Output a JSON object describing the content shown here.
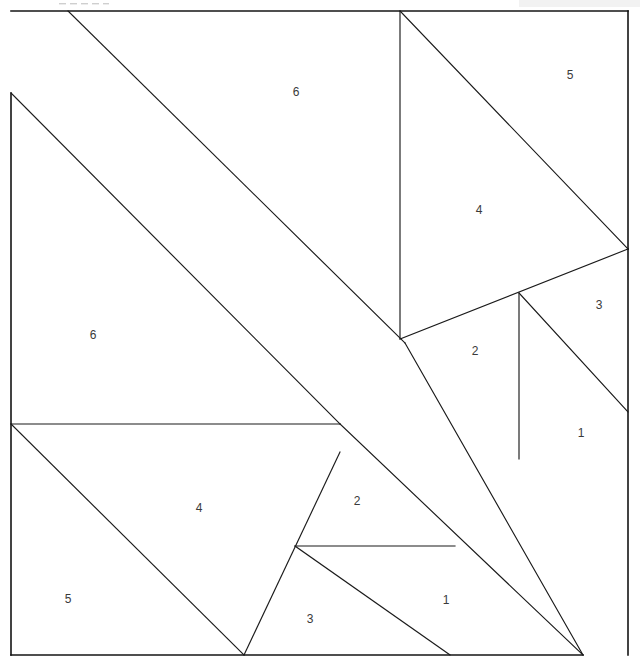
{
  "figure": {
    "kind": "geometric-dissection-diagram",
    "canvas": {
      "width": 640,
      "height": 668
    },
    "stroke_color": "#1a1a1a",
    "fill_color": "#ffffff",
    "label_color": "#3a3a3a"
  },
  "frame": {
    "top_left": [
      11,
      11
    ],
    "top_right": [
      628,
      11
    ],
    "bottom_left": [
      11,
      655
    ],
    "bottom_right": [
      628,
      655
    ]
  },
  "labels": [
    {
      "id": "label-6-upper",
      "text": "6",
      "x": 296,
      "y": 93
    },
    {
      "id": "label-5-upper",
      "text": "5",
      "x": 570,
      "y": 76
    },
    {
      "id": "label-4-upper",
      "text": "4",
      "x": 479,
      "y": 211
    },
    {
      "id": "label-3-upper",
      "text": "3",
      "x": 599,
      "y": 306
    },
    {
      "id": "label-2-upper",
      "text": "2",
      "x": 475,
      "y": 352
    },
    {
      "id": "label-1-upper",
      "text": "1",
      "x": 581,
      "y": 434
    },
    {
      "id": "label-6-lower",
      "text": "6",
      "x": 93,
      "y": 336
    },
    {
      "id": "label-4-lower",
      "text": "4",
      "x": 199,
      "y": 509
    },
    {
      "id": "label-2-lower",
      "text": "2",
      "x": 357,
      "y": 502
    },
    {
      "id": "label-5-lower",
      "text": "5",
      "x": 68,
      "y": 600
    },
    {
      "id": "label-3-lower",
      "text": "3",
      "x": 310,
      "y": 620
    },
    {
      "id": "label-1-lower",
      "text": "1",
      "x": 446,
      "y": 601
    }
  ],
  "pieces": [
    {
      "id": "piece-6-upper",
      "number": "6",
      "points": "68,11 400,11 400,339 405,343 11,11"
    },
    {
      "id": "piece-5-upper",
      "number": "5",
      "points": "400,11 628,11 628,249"
    },
    {
      "id": "piece-4-upper",
      "number": "4",
      "points": "400,11 628,249 519,293 400,339"
    },
    {
      "id": "piece-3-upper",
      "number": "3",
      "points": "628,249 628,412 519,293"
    },
    {
      "id": "piece-2-upper",
      "number": "2",
      "points": "400,339 519,293 519,459"
    },
    {
      "id": "piece-1-upper",
      "number": "1",
      "points": "519,293 628,412 628,655 519,459"
    },
    {
      "id": "piece-6-lower",
      "number": "6",
      "points": "11,93 340,424 11,424"
    },
    {
      "id": "piece-4-lower",
      "number": "4",
      "points": "11,424 340,424 340,452 244,655"
    },
    {
      "id": "piece-5-lower",
      "number": "5",
      "points": "11,424 244,655 11,655"
    },
    {
      "id": "piece-2-lower",
      "number": "2",
      "points": "340,424 455,546 295,546"
    },
    {
      "id": "piece-3-lower",
      "number": "3",
      "points": "295,546 455,546 244,655"
    },
    {
      "id": "piece-1-lower",
      "number": "1",
      "points": "340,424 583,655 295,655"
    }
  ],
  "segments": [
    {
      "id": "seg-frame-top",
      "d": "M 11 11 L 628 11"
    },
    {
      "id": "seg-frame-left",
      "d": "M 11 93 L 11 655"
    },
    {
      "id": "seg-frame-bottom",
      "d": "M 11 655 L 583 655"
    },
    {
      "id": "seg-frame-right-upper",
      "d": "M 628 11 L 628 249"
    },
    {
      "id": "seg-frame-right-lower",
      "d": "M 628 249 L 628 655"
    },
    {
      "id": "seg-big-diag-upper",
      "d": "M 68 11 L 405 343"
    },
    {
      "id": "seg-big-diag-lower",
      "d": "M 11 93 L 340 424"
    },
    {
      "id": "seg-band-left",
      "d": "M 405 343 L 583 655"
    },
    {
      "id": "seg-band-right",
      "d": "M 340 424 L 583 655"
    },
    {
      "id": "seg-vert-400",
      "d": "M 400 11 L 400 339"
    },
    {
      "id": "seg-hyp-5-upper",
      "d": "M 400 11 L 628 249"
    },
    {
      "id": "seg-edge-4-base",
      "d": "M 400 339 L 628 249"
    },
    {
      "id": "seg-vert-519",
      "d": "M 519 293 L 519 459"
    },
    {
      "id": "seg-diag-3-1",
      "d": "M 519 293 L 628 412"
    },
    {
      "id": "seg-horiz-424",
      "d": "M 11 424 L 340 424"
    },
    {
      "id": "seg-diag-4-lower",
      "d": "M 340 452 L 244 655"
    },
    {
      "id": "seg-diag-5-lower",
      "d": "M 11 424 L 244 655"
    },
    {
      "id": "seg-horiz-546",
      "d": "M 295 546 L 455 546"
    },
    {
      "id": "seg-diag-3-lower",
      "d": "M 295 546 L 450 655"
    }
  ],
  "artifacts": {
    "top_dashes": [
      {
        "x": 59,
        "y": 3,
        "w": 7
      },
      {
        "x": 70,
        "y": 3,
        "w": 7
      },
      {
        "x": 81,
        "y": 3,
        "w": 7
      },
      {
        "x": 92,
        "y": 3,
        "w": 7
      },
      {
        "x": 103,
        "y": 3,
        "w": 6
      }
    ],
    "corner_smudge": {
      "x": 519,
      "y": 0,
      "w": 121,
      "h": 7
    }
  }
}
